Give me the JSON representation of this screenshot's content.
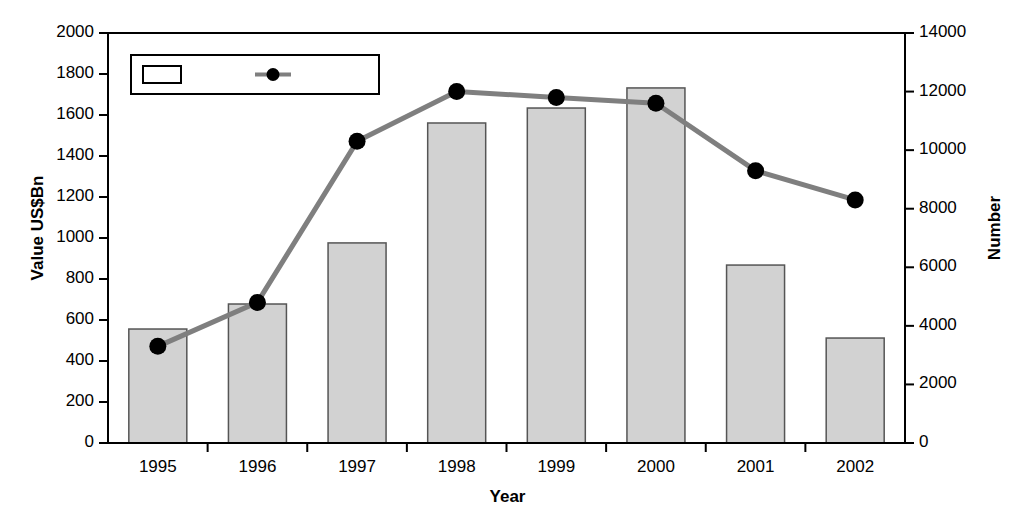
{
  "chart_data": {
    "type": "bar",
    "title": "",
    "subtitle": "",
    "xlabel": "Year",
    "ylabel": "Value US$Bn",
    "y2label": "Number",
    "categories": [
      "1995",
      "1996",
      "1997",
      "1998",
      "1999",
      "2000",
      "2001",
      "2002"
    ],
    "series": [
      {
        "name": "Value",
        "type": "bar",
        "axis": "left",
        "unit": "US$Bn",
        "values": [
          556,
          678,
          976,
          1561,
          1634,
          1732,
          868,
          512
        ],
        "fill_color": "#d2d2d2",
        "border_color": "#555555"
      },
      {
        "name": "Number",
        "type": "line",
        "axis": "right",
        "unit": "count",
        "values": [
          3300,
          4800,
          10300,
          12000,
          11800,
          11600,
          9300,
          8300
        ],
        "line_color": "#7f7f7f",
        "marker_color": "#000000"
      }
    ],
    "ylim": [
      0,
      2000
    ],
    "ytick_step": 200,
    "yticks": [
      "0",
      "200",
      "400",
      "600",
      "800",
      "1000",
      "1200",
      "1400",
      "1600",
      "1800",
      "2000"
    ],
    "y2lim": [
      0,
      14000
    ],
    "y2tick_step": 2000,
    "y2ticks": [
      "0",
      "2000",
      "4000",
      "6000",
      "8000",
      "10000",
      "12000",
      "14000"
    ],
    "grid": false,
    "legend": {
      "position": "top-left-inside",
      "entries": [
        {
          "label": "Value",
          "marker": "hollow-rect-swatch"
        },
        {
          "label": "Number",
          "marker": "line-with-dot-swatch"
        }
      ]
    },
    "axis_line_color": "#000000",
    "background_color": "#ffffff"
  }
}
